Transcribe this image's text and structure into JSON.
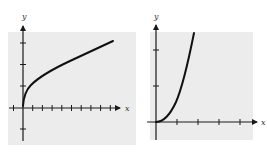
{
  "graphs": [
    {
      "name": "square-root-graph",
      "x_label": "x",
      "y_label": "y",
      "x_ticks_left": 1,
      "x_ticks_right": 10,
      "y_ticks_above": 3,
      "y_ticks_below": 1,
      "curve": "concave increasing from origin (y = sqrt(x) shape)"
    },
    {
      "name": "power-graph",
      "x_label": "x",
      "y_label": "y",
      "x_ticks_right": 4,
      "y_ticks_above": 2,
      "curve": "convex increasing from origin (y = x^2 shape, x >= 0)"
    }
  ],
  "colors": {
    "background": "#ececec",
    "axis": "#1a1a1a",
    "curve": "#111111"
  }
}
